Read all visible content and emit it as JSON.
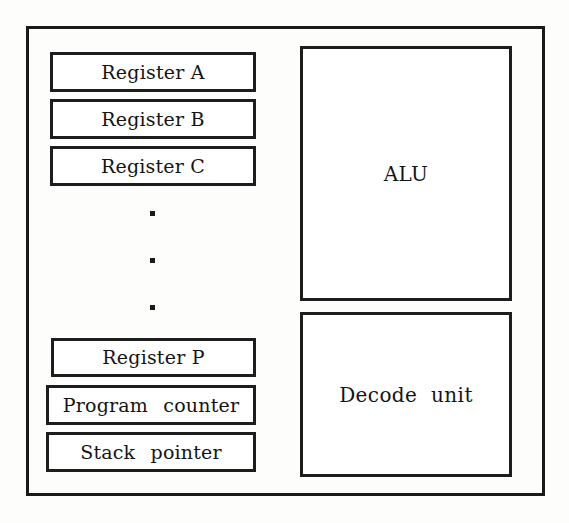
{
  "diagram": {
    "chassis_name": "cpu-outline",
    "stroke_color": "#1a1a1a",
    "fill_color": "#ffffff",
    "background_color": "#fdfdfc"
  },
  "registers": [
    {
      "label": "Register A"
    },
    {
      "label": "Register B"
    },
    {
      "label": "Register C"
    }
  ],
  "ellipsis": {
    "glyph": "·",
    "count": 3,
    "meaning": "additional registers omitted"
  },
  "special_registers": [
    {
      "label": "Register P"
    },
    {
      "label": "Program  counter"
    },
    {
      "label": "Stack  pointer"
    }
  ],
  "units": [
    {
      "label": "ALU"
    },
    {
      "label": "Decode  unit"
    }
  ]
}
